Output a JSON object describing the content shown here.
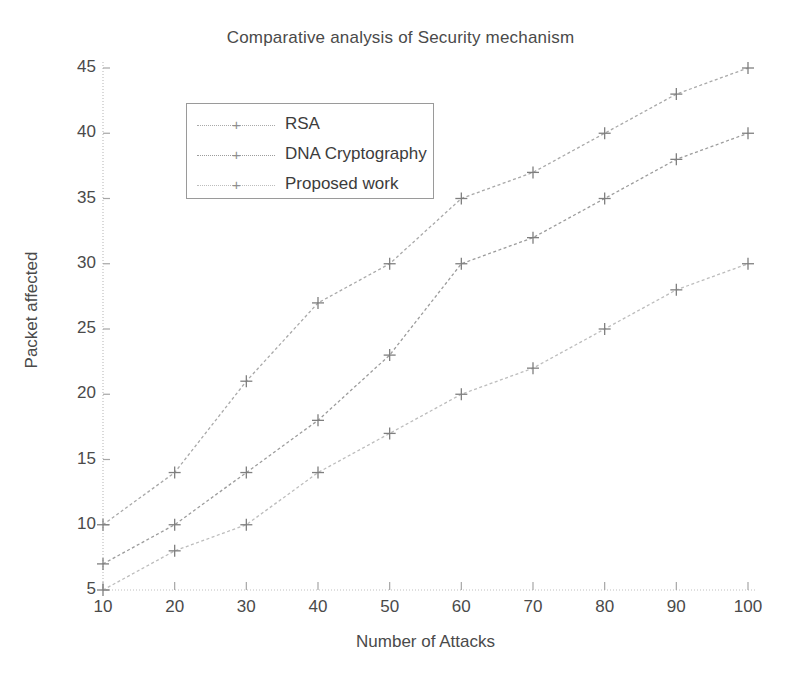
{
  "chart_data": {
    "type": "line",
    "title": "Comparative analysis of Security mechanism",
    "xlabel": "Number of Attacks",
    "ylabel": "Packet affected",
    "x": [
      10,
      20,
      30,
      40,
      50,
      60,
      70,
      80,
      90,
      100
    ],
    "xticklabels": [
      "10",
      "20",
      "30",
      "40",
      "50",
      "60",
      "70",
      "80",
      "90",
      "100"
    ],
    "yticklabels": [
      "5",
      "10",
      "15",
      "20",
      "25",
      "30",
      "35",
      "40",
      "45"
    ],
    "yticks": [
      5,
      10,
      15,
      20,
      25,
      30,
      35,
      40,
      45
    ],
    "xlim": [
      10,
      100
    ],
    "ylim": [
      5,
      45
    ],
    "grid": false,
    "legend_position": "upper left",
    "marker": "plus",
    "linestyle": "dotted",
    "series": [
      {
        "name": "RSA",
        "values": [
          10,
          14,
          21,
          27,
          30,
          35,
          37,
          40,
          43,
          45
        ],
        "color": "#a9a9a9"
      },
      {
        "name": "DNA Cryptography",
        "values": [
          7,
          10,
          14,
          18,
          23,
          30,
          32,
          35,
          38,
          40
        ],
        "color": "#9c9c9c"
      },
      {
        "name": "Proposed work",
        "values": [
          5,
          8,
          10,
          14,
          17,
          20,
          22,
          25,
          28,
          30
        ],
        "color": "#bdbdbd"
      }
    ]
  },
  "legend": {
    "items": [
      {
        "label": "RSA",
        "marker": "plus-marker"
      },
      {
        "label": "DNA Cryptography",
        "marker": "plus-marker"
      },
      {
        "label": "Proposed work",
        "marker": "plus-marker"
      }
    ]
  }
}
